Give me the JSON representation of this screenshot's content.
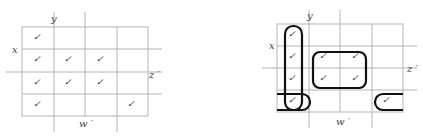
{
  "figure": {
    "left_map": {
      "name": "K-map unsimplified",
      "labels": {
        "top": "y",
        "left": "x",
        "right": "z ′",
        "bottom": "w ′"
      },
      "rows": 4,
      "cols": 4,
      "check_glyph": "✓",
      "marked_cells": [
        [
          0,
          0
        ],
        [
          1,
          0
        ],
        [
          1,
          1
        ],
        [
          1,
          2
        ],
        [
          2,
          0
        ],
        [
          2,
          1
        ],
        [
          2,
          2
        ],
        [
          3,
          0
        ],
        [
          3,
          3
        ]
      ]
    },
    "right_map": {
      "name": "K-map with groupings",
      "labels": {
        "top": "y",
        "left": "x",
        "right": "z ′",
        "bottom": "w ′"
      },
      "rows": 4,
      "cols": 4,
      "check_glyph": "✓",
      "marked_cells": [
        [
          0,
          0
        ],
        [
          1,
          0
        ],
        [
          1,
          1
        ],
        [
          1,
          2
        ],
        [
          2,
          0
        ],
        [
          2,
          1
        ],
        [
          2,
          2
        ],
        [
          3,
          0
        ],
        [
          3,
          3
        ]
      ],
      "groups": [
        {
          "name": "column-1-group",
          "cells": [
            [
              0,
              0
            ],
            [
              1,
              0
            ],
            [
              2,
              0
            ],
            [
              3,
              0
            ]
          ]
        },
        {
          "name": "center-quad-group",
          "cells": [
            [
              1,
              1
            ],
            [
              1,
              2
            ],
            [
              2,
              1
            ],
            [
              2,
              2
            ]
          ]
        },
        {
          "name": "wraparound-row-4-group",
          "cells": [
            [
              3,
              0
            ],
            [
              3,
              3
            ]
          ]
        }
      ]
    }
  }
}
